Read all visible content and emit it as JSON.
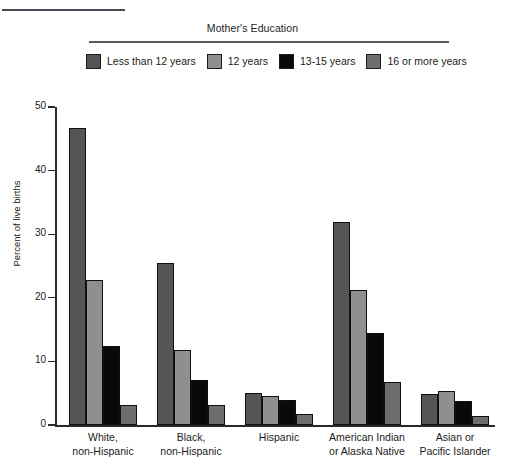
{
  "legend": {
    "title": "Mother's Education",
    "items": [
      {
        "label": "Less than 12 years",
        "color": "#555555"
      },
      {
        "label": "12 years",
        "color": "#8f8f8f"
      },
      {
        "label": "13-15 years",
        "color": "#0a0a0a"
      },
      {
        "label": "16 or more years",
        "color": "#6e6e6e"
      }
    ]
  },
  "chart_data": {
    "type": "bar",
    "title": "Mother's Education",
    "xlabel": "",
    "ylabel": "Percent of live births",
    "ylim": [
      0,
      50
    ],
    "yticks": [
      0,
      10,
      20,
      30,
      40,
      50
    ],
    "ytick_labels": [
      "0",
      "10",
      "20",
      "30",
      "40",
      "50"
    ],
    "grid": false,
    "legend_position": "top",
    "categories": [
      "White,\nnon-Hispanic",
      "Black,\nnon-Hispanic",
      "Hispanic",
      "American Indian\nor Alaska Native",
      "Asian or\nPacific Islander"
    ],
    "category_lines": [
      [
        "White,",
        "non-Hispanic"
      ],
      [
        "Black,",
        "non-Hispanic"
      ],
      [
        "Hispanic",
        ""
      ],
      [
        "American Indian",
        "or Alaska Native"
      ],
      [
        "Asian or",
        "Pacific Islander"
      ]
    ],
    "series": [
      {
        "name": "Less than 12 years",
        "color": "#555555",
        "values": [
          46.7,
          25.5,
          5.1,
          31.9,
          4.9
        ]
      },
      {
        "name": "12 years",
        "color": "#8f8f8f",
        "values": [
          22.8,
          11.8,
          4.5,
          21.3,
          5.4
        ]
      },
      {
        "name": "13-15 years",
        "color": "#0a0a0a",
        "values": [
          12.4,
          7.1,
          4.0,
          14.4,
          3.7
        ]
      },
      {
        "name": "16 or more years",
        "color": "#6e6e6e",
        "values": [
          3.1,
          3.1,
          1.8,
          6.8,
          1.4
        ]
      }
    ]
  }
}
